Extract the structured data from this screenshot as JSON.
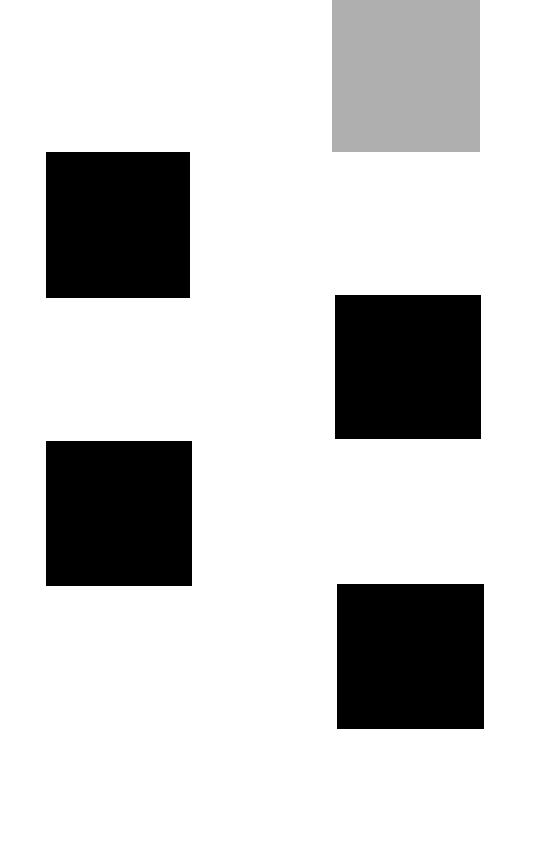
{
  "colors": {
    "background": "#ffffff",
    "tile_loading": "#afafaf",
    "tile_loaded": "#000000"
  },
  "grid": {
    "layout": "masonry-two-column",
    "tiles": [
      {
        "id": "tile-1",
        "column": "right",
        "state": "loading",
        "x": 332,
        "y": 0,
        "w": 148,
        "h": 152
      },
      {
        "id": "tile-2",
        "column": "left",
        "state": "loaded",
        "x": 46,
        "y": 152,
        "w": 144,
        "h": 146
      },
      {
        "id": "tile-3",
        "column": "right",
        "state": "loaded",
        "x": 335,
        "y": 295,
        "w": 146,
        "h": 144
      },
      {
        "id": "tile-4",
        "column": "left",
        "state": "loaded",
        "x": 46,
        "y": 441,
        "w": 146,
        "h": 145
      },
      {
        "id": "tile-5",
        "column": "right",
        "state": "loaded",
        "x": 337,
        "y": 584,
        "w": 147,
        "h": 145
      }
    ]
  }
}
